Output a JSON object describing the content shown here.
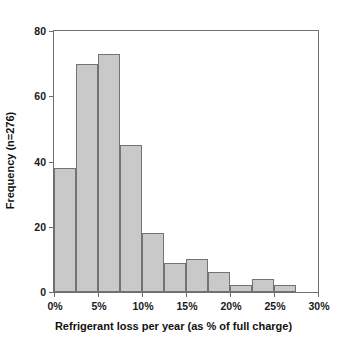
{
  "chart_data": {
    "type": "bar",
    "title": "",
    "subtitle": "",
    "xlabel": "Refrigerant loss per year (as % of full charge)",
    "ylabel": "Frequency (n=276)",
    "xlim": [
      0,
      30
    ],
    "ylim": [
      0,
      80
    ],
    "grid": false,
    "legend": null,
    "bin_width": 2.5,
    "x_unit": "%",
    "xticks": [
      0,
      5,
      10,
      15,
      20,
      25,
      30
    ],
    "xtick_labels": [
      "0%",
      "5%",
      "10%",
      "15%",
      "20%",
      "25%",
      "30%"
    ],
    "yticks": [
      0,
      20,
      40,
      60,
      80
    ],
    "ytick_labels": [
      "0",
      "20",
      "40",
      "60",
      "80"
    ],
    "bin_edges": [
      0,
      2.5,
      5,
      7.5,
      10,
      12.5,
      15,
      17.5,
      20,
      22.5,
      25,
      27.5
    ],
    "categories": [
      "0-2.5%",
      "2.5-5%",
      "5-7.5%",
      "7.5-10%",
      "10-12.5%",
      "12.5-15%",
      "15-17.5%",
      "17.5-20%",
      "20-22.5%",
      "22.5-25%",
      "25-27.5%"
    ],
    "values": [
      38,
      70,
      73,
      45,
      18,
      9,
      10,
      6,
      2,
      4,
      2
    ],
    "bar_fill_color": "#c9c9c9",
    "bar_border_color": "#737373",
    "axis_color": "#6e6e6e",
    "background_color": "#ffffff"
  }
}
